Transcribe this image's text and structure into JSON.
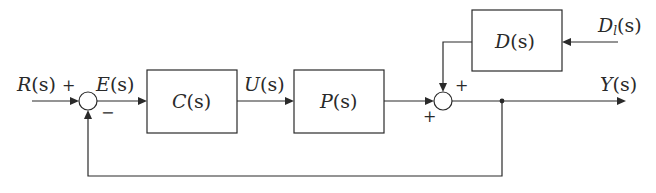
{
  "diagram": {
    "type": "feedback control block diagram",
    "blocks": [
      {
        "id": "C",
        "label": "C(s)",
        "name": "P",
        "paren": "(s)"
      },
      {
        "id": "P",
        "label": "P(s)"
      },
      {
        "id": "D",
        "label": "D(s)"
      }
    ],
    "signals": {
      "reference": "R(s)",
      "error": "E(s)",
      "control": "U(s)",
      "output": "Y(s)",
      "disturbance": "Dl(s)"
    },
    "summing_junctions": [
      {
        "id": "sum1",
        "signs": {
          "left": "+",
          "bottom": "−"
        }
      },
      {
        "id": "sum2",
        "signs": {
          "left": "+",
          "top": "+"
        }
      }
    ],
    "edges": [
      {
        "from": "R(s)",
        "to": "sum1",
        "sign": "+"
      },
      {
        "from": "sum1",
        "to": "C",
        "label": "E(s)"
      },
      {
        "from": "C",
        "to": "P",
        "label": "U(s)"
      },
      {
        "from": "P",
        "to": "sum2",
        "sign": "+"
      },
      {
        "from": "Dl(s)",
        "to": "D"
      },
      {
        "from": "D",
        "to": "sum2",
        "sign": "+"
      },
      {
        "from": "sum2",
        "to": "Y(s)"
      },
      {
        "from": "Y(s)",
        "to": "sum1",
        "sign": "−",
        "kind": "unity feedback"
      }
    ]
  },
  "labels": {
    "R_main": "R",
    "R_arg": "(s)",
    "plus_r": "+",
    "E_main": "E",
    "E_arg": "(s)",
    "minus_fb": "−",
    "C_main": "C",
    "C_arg": "(s)",
    "U_main": "U",
    "U_arg": "(s)",
    "P_main": "P",
    "P_arg": "(s)",
    "D_main": "D",
    "D_arg": "(s)",
    "Dl_main": "D",
    "Dl_sub": "l",
    "Dl_arg": "(s)",
    "Y_main": "Y",
    "Y_arg": "(s)",
    "plus_p": "+",
    "plus_d": "+"
  }
}
